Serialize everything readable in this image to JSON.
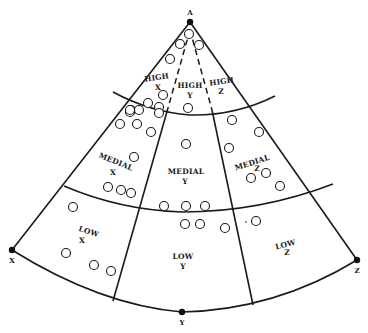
{
  "vertices": {
    "A": "A",
    "X": "X",
    "Y": "Y",
    "Z": "Z"
  },
  "regions": {
    "high_x": {
      "line1": "HIGH",
      "line2": "X"
    },
    "high_y": {
      "line1": "HIGH",
      "line2": "Y"
    },
    "high_z": {
      "line1": "HIGH",
      "line2": "Z"
    },
    "medial_x": {
      "line1": "MEDIAL",
      "line2": "X"
    },
    "medial_y": {
      "line1": "MEDIAL",
      "line2": "Y"
    },
    "medial_z": {
      "line1": "MEDIAL",
      "line2": "Z"
    },
    "low_x": {
      "line1": "LOW",
      "line2": "X"
    },
    "low_y": {
      "line1": "LOW",
      "line2": "Y"
    },
    "low_z": {
      "line1": "LOW",
      "line2": "Z"
    }
  },
  "colors": {
    "ink": "#1a1a1a",
    "background": "#ffffff"
  }
}
